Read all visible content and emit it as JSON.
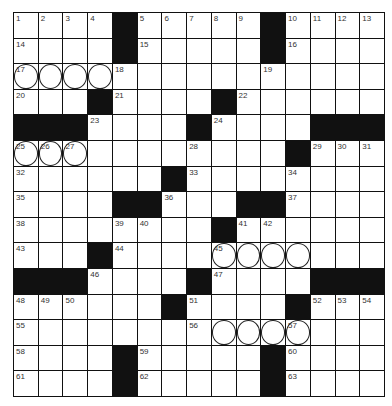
{
  "puzzle": {
    "rows": 15,
    "cols": 15,
    "colors": {
      "black": "#111111",
      "white": "#ffffff",
      "line": "#111111"
    },
    "grid": [
      "....#.....#....",
      "....#.....#....",
      "...............",
      "...#....#......",
      "###....#....###",
      "...........#...",
      "......#........",
      "....##...##....",
      "........#......",
      "...#...........",
      "###....#....###",
      "......#....#...",
      "...............",
      "....#.....#....",
      "....#.....#...."
    ],
    "numbers": [
      {
        "r": 0,
        "c": 0,
        "n": "1"
      },
      {
        "r": 0,
        "c": 1,
        "n": "2"
      },
      {
        "r": 0,
        "c": 2,
        "n": "3"
      },
      {
        "r": 0,
        "c": 3,
        "n": "4"
      },
      {
        "r": 0,
        "c": 5,
        "n": "5"
      },
      {
        "r": 0,
        "c": 6,
        "n": "6"
      },
      {
        "r": 0,
        "c": 7,
        "n": "7"
      },
      {
        "r": 0,
        "c": 8,
        "n": "8"
      },
      {
        "r": 0,
        "c": 9,
        "n": "9"
      },
      {
        "r": 0,
        "c": 11,
        "n": "10"
      },
      {
        "r": 0,
        "c": 12,
        "n": "11"
      },
      {
        "r": 0,
        "c": 13,
        "n": "12"
      },
      {
        "r": 0,
        "c": 14,
        "n": "13"
      },
      {
        "r": 1,
        "c": 0,
        "n": "14"
      },
      {
        "r": 1,
        "c": 5,
        "n": "15"
      },
      {
        "r": 1,
        "c": 11,
        "n": "16"
      },
      {
        "r": 2,
        "c": 0,
        "n": "17"
      },
      {
        "r": 2,
        "c": 4,
        "n": "18"
      },
      {
        "r": 2,
        "c": 10,
        "n": "19"
      },
      {
        "r": 3,
        "c": 0,
        "n": "20"
      },
      {
        "r": 3,
        "c": 4,
        "n": "21"
      },
      {
        "r": 3,
        "c": 9,
        "n": "22"
      },
      {
        "r": 4,
        "c": 3,
        "n": "23"
      },
      {
        "r": 4,
        "c": 8,
        "n": "24"
      },
      {
        "r": 5,
        "c": 0,
        "n": "25"
      },
      {
        "r": 5,
        "c": 1,
        "n": "26"
      },
      {
        "r": 5,
        "c": 2,
        "n": "27"
      },
      {
        "r": 5,
        "c": 7,
        "n": "28"
      },
      {
        "r": 5,
        "c": 12,
        "n": "29"
      },
      {
        "r": 5,
        "c": 13,
        "n": "30"
      },
      {
        "r": 5,
        "c": 14,
        "n": "31"
      },
      {
        "r": 6,
        "c": 0,
        "n": "32"
      },
      {
        "r": 6,
        "c": 7,
        "n": "33"
      },
      {
        "r": 6,
        "c": 11,
        "n": "34"
      },
      {
        "r": 7,
        "c": 0,
        "n": "35"
      },
      {
        "r": 7,
        "c": 6,
        "n": "36"
      },
      {
        "r": 7,
        "c": 11,
        "n": "37"
      },
      {
        "r": 8,
        "c": 0,
        "n": "38"
      },
      {
        "r": 8,
        "c": 4,
        "n": "39"
      },
      {
        "r": 8,
        "c": 5,
        "n": "40"
      },
      {
        "r": 8,
        "c": 9,
        "n": "41"
      },
      {
        "r": 8,
        "c": 10,
        "n": "42"
      },
      {
        "r": 9,
        "c": 0,
        "n": "43"
      },
      {
        "r": 9,
        "c": 4,
        "n": "44"
      },
      {
        "r": 9,
        "c": 8,
        "n": "45"
      },
      {
        "r": 10,
        "c": 3,
        "n": "46"
      },
      {
        "r": 10,
        "c": 8,
        "n": "47"
      },
      {
        "r": 11,
        "c": 0,
        "n": "48"
      },
      {
        "r": 11,
        "c": 1,
        "n": "49"
      },
      {
        "r": 11,
        "c": 2,
        "n": "50"
      },
      {
        "r": 11,
        "c": 7,
        "n": "51"
      },
      {
        "r": 11,
        "c": 12,
        "n": "52"
      },
      {
        "r": 11,
        "c": 13,
        "n": "53"
      },
      {
        "r": 11,
        "c": 14,
        "n": "54"
      },
      {
        "r": 12,
        "c": 0,
        "n": "55"
      },
      {
        "r": 12,
        "c": 7,
        "n": "56"
      },
      {
        "r": 12,
        "c": 11,
        "n": "57"
      },
      {
        "r": 13,
        "c": 0,
        "n": "58"
      },
      {
        "r": 13,
        "c": 5,
        "n": "59"
      },
      {
        "r": 13,
        "c": 11,
        "n": "60"
      },
      {
        "r": 14,
        "c": 0,
        "n": "61"
      },
      {
        "r": 14,
        "c": 5,
        "n": "62"
      },
      {
        "r": 14,
        "c": 11,
        "n": "63"
      }
    ],
    "circles": [
      {
        "r": 2,
        "c": 0
      },
      {
        "r": 2,
        "c": 1
      },
      {
        "r": 2,
        "c": 2
      },
      {
        "r": 2,
        "c": 3
      },
      {
        "r": 5,
        "c": 0
      },
      {
        "r": 5,
        "c": 1
      },
      {
        "r": 5,
        "c": 2
      },
      {
        "r": 9,
        "c": 8
      },
      {
        "r": 9,
        "c": 9
      },
      {
        "r": 9,
        "c": 10
      },
      {
        "r": 9,
        "c": 11
      },
      {
        "r": 12,
        "c": 8
      },
      {
        "r": 12,
        "c": 9
      },
      {
        "r": 12,
        "c": 10
      },
      {
        "r": 12,
        "c": 11
      }
    ]
  }
}
